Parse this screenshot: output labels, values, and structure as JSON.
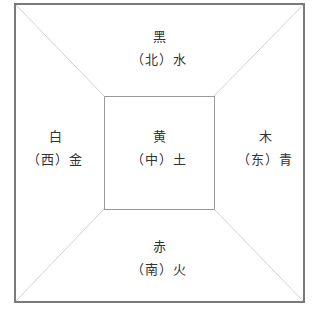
{
  "diagram": {
    "type": "five-elements-directions",
    "colors": {
      "outer_border": "#7a7a7a",
      "inner_border": "#9a9a9a",
      "diagonal": "#cfcfcf",
      "text": "#333333"
    },
    "regions": {
      "north": {
        "color": "黑",
        "direction": "北",
        "element": "水",
        "line2": "（北）水"
      },
      "west": {
        "color": "白",
        "direction": "西",
        "element": "金",
        "line2": "（西）金"
      },
      "center": {
        "color": "黄",
        "direction": "中",
        "element": "土",
        "line2": "（中）土"
      },
      "east": {
        "color": "木",
        "direction": "东",
        "element": "青",
        "line2": "（东）青"
      },
      "south": {
        "color": "赤",
        "direction": "南",
        "element": "火",
        "line2": "（南）火"
      }
    }
  }
}
